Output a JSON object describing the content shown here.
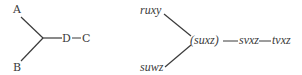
{
  "left_tree": {
    "leaf_top": "A",
    "leaf_bottom": "B",
    "mid": "D",
    "end": "C"
  },
  "right_tree": {
    "leaf_top": "ruxy",
    "leaf_bottom": "suwz",
    "junction": "(suxz)",
    "mid": "svxz",
    "end": "tvxz"
  },
  "colors": {
    "line": "#3a3a3a",
    "text": "#3a3a3a"
  }
}
